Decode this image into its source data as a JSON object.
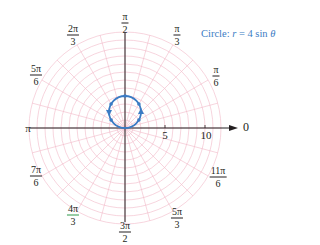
{
  "chart_data": {
    "type": "line",
    "subtype": "polar",
    "title": "Circle: r = 4 sin θ",
    "equation": "r = 4 sin θ",
    "caption_prefix": "Circle:",
    "caption_lhs": "r",
    "caption_rhs": "= 4 sin",
    "caption_var": "θ",
    "series": [
      {
        "name": "r = 4 sin θ",
        "color": "#3b7cc4",
        "theta_range": [
          0,
          3.14159
        ],
        "points": [
          {
            "theta": "0",
            "r": 0
          },
          {
            "theta": "π/6",
            "r": 2
          },
          {
            "theta": "π/3",
            "r": 3.46
          },
          {
            "theta": "π/2",
            "r": 4
          },
          {
            "theta": "2π/3",
            "r": 3.46
          },
          {
            "theta": "5π/6",
            "r": 2
          },
          {
            "theta": "π",
            "r": 0
          }
        ],
        "direction_arrows": "counterclockwise"
      }
    ],
    "radial_axis": {
      "ticks": [
        5,
        10
      ],
      "tick_labels": [
        "5",
        "10"
      ],
      "range": [
        0,
        12
      ],
      "grid_circle_step": 1
    },
    "angular_axis": {
      "labels": [
        {
          "angle_deg": 0,
          "num": "0",
          "den": ""
        },
        {
          "angle_deg": 30,
          "num": "π",
          "den": "6"
        },
        {
          "angle_deg": 60,
          "num": "π",
          "den": "3"
        },
        {
          "angle_deg": 90,
          "num": "π",
          "den": "2"
        },
        {
          "angle_deg": 120,
          "num": "2π",
          "den": "3"
        },
        {
          "angle_deg": 150,
          "num": "5π",
          "den": "6"
        },
        {
          "angle_deg": 180,
          "num": "π",
          "den": ""
        },
        {
          "angle_deg": 210,
          "num": "7π",
          "den": "6"
        },
        {
          "angle_deg": 240,
          "num": "4π",
          "den": "3"
        },
        {
          "angle_deg": 270,
          "num": "3π",
          "den": "2"
        },
        {
          "angle_deg": 300,
          "num": "5π",
          "den": "3"
        },
        {
          "angle_deg": 330,
          "num": "11π",
          "den": "6"
        }
      ],
      "grid_spoke_step_deg": 15
    },
    "grid": true,
    "grid_color": "#f2b8c8",
    "axis_color": "#231f20"
  },
  "labels": {
    "zero": "0",
    "pi": "π",
    "pi_6_num": "π",
    "pi_6_den": "6",
    "pi_3_num": "π",
    "pi_3_den": "3",
    "pi_2_num": "π",
    "pi_2_den": "2",
    "two_pi_3_num": "2π",
    "two_pi_3_den": "3",
    "five_pi_6_num": "5π",
    "five_pi_6_den": "6",
    "seven_pi_6_num": "7π",
    "seven_pi_6_den": "6",
    "four_pi_3_num": "4π",
    "four_pi_3_den": "3",
    "three_pi_2_num": "3π",
    "three_pi_2_den": "2",
    "five_pi_3_num": "5π",
    "five_pi_3_den": "3",
    "eleven_pi_6_num": "11π",
    "eleven_pi_6_den": "6",
    "tick_5": "5",
    "tick_10": "10"
  }
}
